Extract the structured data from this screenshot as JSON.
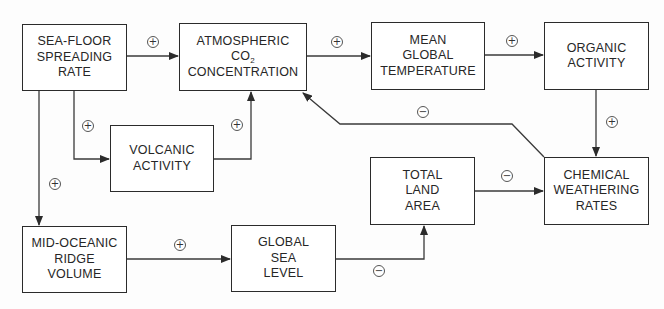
{
  "diagram": {
    "type": "causal-loop",
    "nodes": {
      "seafloor": {
        "lines": [
          "SEA-FLOOR",
          "SPREADING",
          "RATE"
        ]
      },
      "co2": {
        "line1": "ATMOSPHERIC",
        "co": "CO",
        "sub": "2",
        "line3": "CONCENTRATION"
      },
      "temperature": {
        "lines": [
          "MEAN",
          "GLOBAL",
          "TEMPERATURE"
        ]
      },
      "organic": {
        "lines": [
          "ORGANIC",
          "ACTIVITY"
        ]
      },
      "volcanic": {
        "lines": [
          "VOLCANIC",
          "ACTIVITY"
        ]
      },
      "land": {
        "lines": [
          "TOTAL",
          "LAND",
          "AREA"
        ]
      },
      "weathering": {
        "lines": [
          "CHEMICAL",
          "WEATHERING",
          "RATES"
        ]
      },
      "ridge": {
        "lines": [
          "MID-OCEANIC",
          "RIDGE",
          "VOLUME"
        ]
      },
      "sealevel": {
        "lines": [
          "GLOBAL",
          "SEA",
          "LEVEL"
        ]
      }
    },
    "edges": [
      {
        "from": "SEA-FLOOR SPREADING RATE",
        "to": "ATMOSPHERIC CO2 CONCENTRATION",
        "sign": "+"
      },
      {
        "from": "SEA-FLOOR SPREADING RATE",
        "to": "VOLCANIC ACTIVITY",
        "sign": "+"
      },
      {
        "from": "VOLCANIC ACTIVITY",
        "to": "ATMOSPHERIC CO2 CONCENTRATION",
        "sign": "+"
      },
      {
        "from": "SEA-FLOOR SPREADING RATE",
        "to": "MID-OCEANIC RIDGE VOLUME",
        "sign": "+"
      },
      {
        "from": "ATMOSPHERIC CO2 CONCENTRATION",
        "to": "MEAN GLOBAL TEMPERATURE",
        "sign": "+"
      },
      {
        "from": "MEAN GLOBAL TEMPERATURE",
        "to": "ORGANIC ACTIVITY",
        "sign": "+"
      },
      {
        "from": "ORGANIC ACTIVITY",
        "to": "CHEMICAL WEATHERING RATES",
        "sign": "+"
      },
      {
        "from": "CHEMICAL WEATHERING RATES",
        "to": "ATMOSPHERIC CO2 CONCENTRATION",
        "sign": "−"
      },
      {
        "from": "MID-OCEANIC RIDGE VOLUME",
        "to": "GLOBAL SEA LEVEL",
        "sign": "+"
      },
      {
        "from": "GLOBAL SEA LEVEL",
        "to": "TOTAL LAND AREA",
        "sign": "−"
      },
      {
        "from": "TOTAL LAND AREA",
        "to": "CHEMICAL WEATHERING RATES",
        "sign": "−"
      }
    ],
    "signs": {
      "seafloor_co2": "+",
      "seafloor_volcanic": "+",
      "volcanic_co2": "+",
      "seafloor_ridge": "+",
      "co2_temp": "+",
      "temp_organic": "+",
      "organic_weathering": "+",
      "weathering_co2": "−",
      "ridge_sealevel": "+",
      "sealevel_land": "−",
      "land_weathering": "−"
    }
  }
}
